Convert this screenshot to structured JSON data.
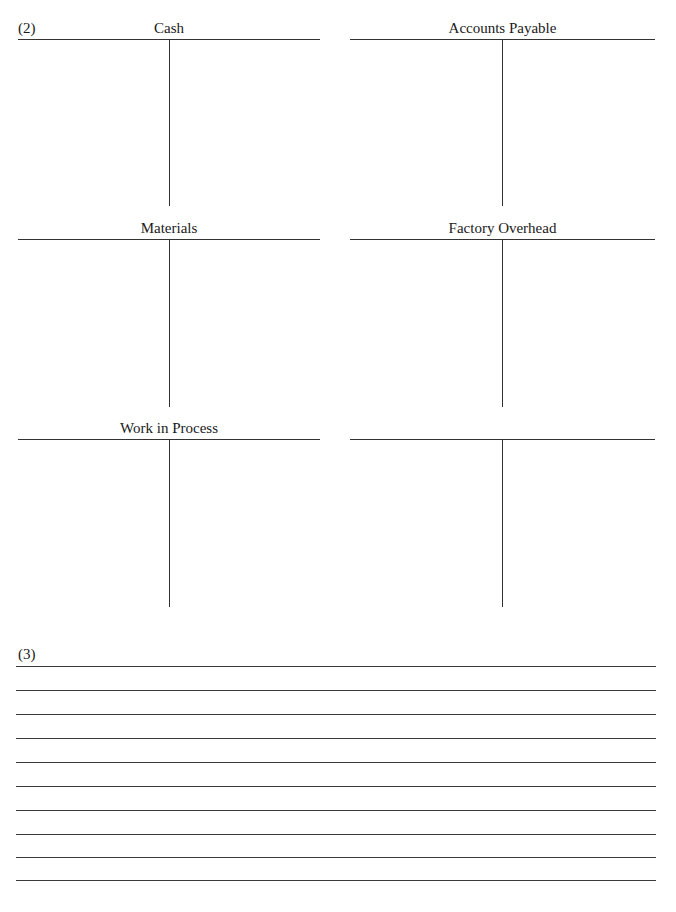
{
  "part2": {
    "label": "(2)",
    "accounts": [
      {
        "title": "Cash"
      },
      {
        "title": "Accounts Payable"
      },
      {
        "title": "Materials"
      },
      {
        "title": "Factory Overhead"
      },
      {
        "title": "Work in Process"
      },
      {
        "title": ""
      }
    ]
  },
  "part3": {
    "label": "(3)",
    "line_count": 10
  }
}
